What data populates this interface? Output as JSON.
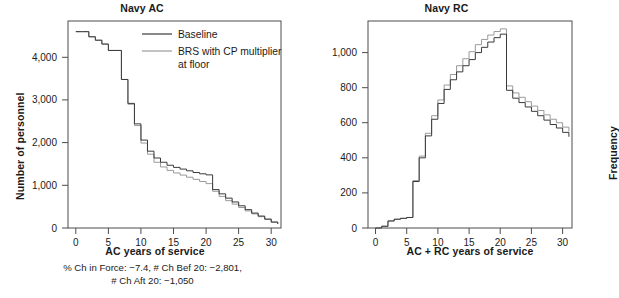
{
  "figure": {
    "caption": {
      "line1": "% Ch in Force: −7.4, # Ch Bef 20: −2,801,",
      "line2": "# Ch Aft 20: −1,050"
    }
  },
  "colors": {
    "baseline": "#3a3a3a",
    "brs": "#9a9a9a",
    "axis": "#4d4d4d",
    "frame": "#4d4d4d",
    "text": "#1a1a1a",
    "background": "#ffffff"
  },
  "legend": {
    "position": "top-right-inside",
    "entries": [
      {
        "label": "Baseline",
        "color": "#3a3a3a"
      },
      {
        "label": "BRS with CP multiplier",
        "label2": "at floor",
        "color": "#9a9a9a"
      }
    ]
  },
  "chart_data": [
    {
      "id": "navy-ac",
      "type": "line",
      "drawstyle": "steps-post",
      "title": "Navy AC",
      "xlabel": "AC years of service",
      "ylabel": "Number of personnel",
      "xlim": [
        -1.2,
        31.5
      ],
      "ylim": [
        0,
        4850
      ],
      "xticks": [
        0,
        5,
        10,
        15,
        20,
        25,
        30
      ],
      "xticklabels": [
        "0",
        "5",
        "10",
        "15",
        "20",
        "25",
        "30"
      ],
      "yticks": [
        0,
        1000,
        2000,
        3000,
        4000
      ],
      "yticklabels": [
        "0",
        "1,000",
        "2,000",
        "3,000",
        "4,000"
      ],
      "grid": false,
      "x": [
        0,
        1,
        2,
        3,
        4,
        5,
        6,
        7,
        8,
        9,
        10,
        11,
        12,
        13,
        14,
        15,
        16,
        17,
        18,
        19,
        20,
        21,
        22,
        23,
        24,
        25,
        26,
        27,
        28,
        29,
        30,
        31
      ],
      "series": [
        {
          "name": "Baseline",
          "color": "#3a3a3a",
          "values": [
            4600,
            4600,
            4480,
            4400,
            4310,
            4160,
            4160,
            3480,
            2920,
            2440,
            2060,
            1800,
            1640,
            1540,
            1470,
            1420,
            1380,
            1340,
            1300,
            1270,
            1245,
            900,
            800,
            700,
            610,
            520,
            430,
            350,
            280,
            210,
            140,
            95
          ]
        },
        {
          "name": "BRS with CP multiplier at floor",
          "color": "#9a9a9a",
          "values": [
            4600,
            4600,
            4480,
            4400,
            4310,
            4160,
            4160,
            3480,
            2900,
            2400,
            1990,
            1730,
            1540,
            1430,
            1350,
            1290,
            1240,
            1190,
            1140,
            1090,
            1040,
            860,
            740,
            640,
            560,
            480,
            400,
            330,
            265,
            200,
            135,
            90
          ]
        }
      ],
      "annotations": [
        "% Ch in Force: −7.4, # Ch Bef 20: −2,801,",
        "# Ch Aft 20: −1,050"
      ]
    },
    {
      "id": "navy-rc",
      "type": "line",
      "drawstyle": "steps-post",
      "title": "Navy RC",
      "xlabel": "AC + RC years of service",
      "ylabel": "Frequency",
      "xlim": [
        -1.2,
        31.5
      ],
      "ylim": [
        0,
        1180
      ],
      "xticks": [
        0,
        5,
        10,
        15,
        20,
        25,
        30
      ],
      "xticklabels": [
        "0",
        "5",
        "10",
        "15",
        "20",
        "25",
        "30"
      ],
      "yticks": [
        0,
        200,
        400,
        600,
        800,
        1000
      ],
      "yticklabels": [
        "0",
        "200",
        "400",
        "600",
        "800",
        "1,000"
      ],
      "grid": false,
      "x": [
        0,
        1,
        2,
        3,
        4,
        5,
        6,
        7,
        8,
        9,
        10,
        11,
        12,
        13,
        14,
        15,
        16,
        17,
        18,
        19,
        20,
        21,
        22,
        23,
        24,
        25,
        26,
        27,
        28,
        29,
        30,
        31
      ],
      "series": [
        {
          "name": "Baseline",
          "color": "#3a3a3a",
          "values": [
            0,
            10,
            40,
            50,
            55,
            60,
            265,
            400,
            525,
            620,
            710,
            790,
            845,
            890,
            925,
            960,
            1000,
            1030,
            1060,
            1085,
            1105,
            785,
            740,
            715,
            690,
            665,
            640,
            615,
            590,
            570,
            545,
            520
          ],
          "note": "peaks at year 20 then drops sharply"
        },
        {
          "name": "BRS with CP multiplier at floor",
          "color": "#9a9a9a",
          "values": [
            0,
            10,
            40,
            50,
            55,
            60,
            270,
            410,
            540,
            640,
            730,
            815,
            875,
            925,
            965,
            1005,
            1045,
            1075,
            1100,
            1120,
            1135,
            810,
            770,
            745,
            720,
            695,
            670,
            645,
            620,
            600,
            575,
            550
          ],
          "note": "peaks at year 20 then drops sharply"
        }
      ]
    }
  ]
}
